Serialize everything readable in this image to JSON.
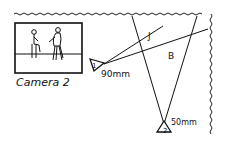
{
  "diagram": {
    "camera_view_caption": "Camera 2",
    "cameras": [
      {
        "id": "1",
        "focal_length": "90mm"
      },
      {
        "id": "2",
        "focal_length": "50mm"
      }
    ],
    "zones": [
      {
        "label": "J"
      },
      {
        "label": "B"
      }
    ]
  }
}
